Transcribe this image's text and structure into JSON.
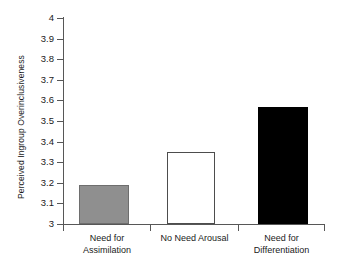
{
  "chart_data": {
    "type": "bar",
    "title": "",
    "xlabel": "",
    "ylabel": "Perceived Ingroup Overinclusiveness",
    "categories": [
      "Need for Assimilation",
      "No Need Arousal",
      "Need for Differentiation"
    ],
    "values": [
      3.19,
      3.35,
      3.57
    ],
    "ylim": [
      3,
      4
    ],
    "yticks": [
      "3",
      "3.1",
      "3.2",
      "3.3",
      "3.4",
      "3.5",
      "3.6",
      "3.7",
      "3.8",
      "3.9",
      "4"
    ],
    "ytick_values": [
      3,
      3.1,
      3.2,
      3.3,
      3.4,
      3.5,
      3.6,
      3.7,
      3.8,
      3.9,
      4
    ],
    "grid": false,
    "legend": "none",
    "series": [
      {
        "name": "Perceived Ingroup Overinclusiveness",
        "values": [
          3.19,
          3.35,
          3.57
        ],
        "colors": [
          "#8f8f8f",
          "#ffffff",
          "#000000"
        ]
      }
    ],
    "bar_styles": [
      "gray",
      "white",
      "black"
    ],
    "category_lines": [
      [
        "Need for",
        "Assimilation"
      ],
      [
        "No Need Arousal",
        ""
      ],
      [
        "Need for",
        "Differentiation"
      ]
    ]
  }
}
